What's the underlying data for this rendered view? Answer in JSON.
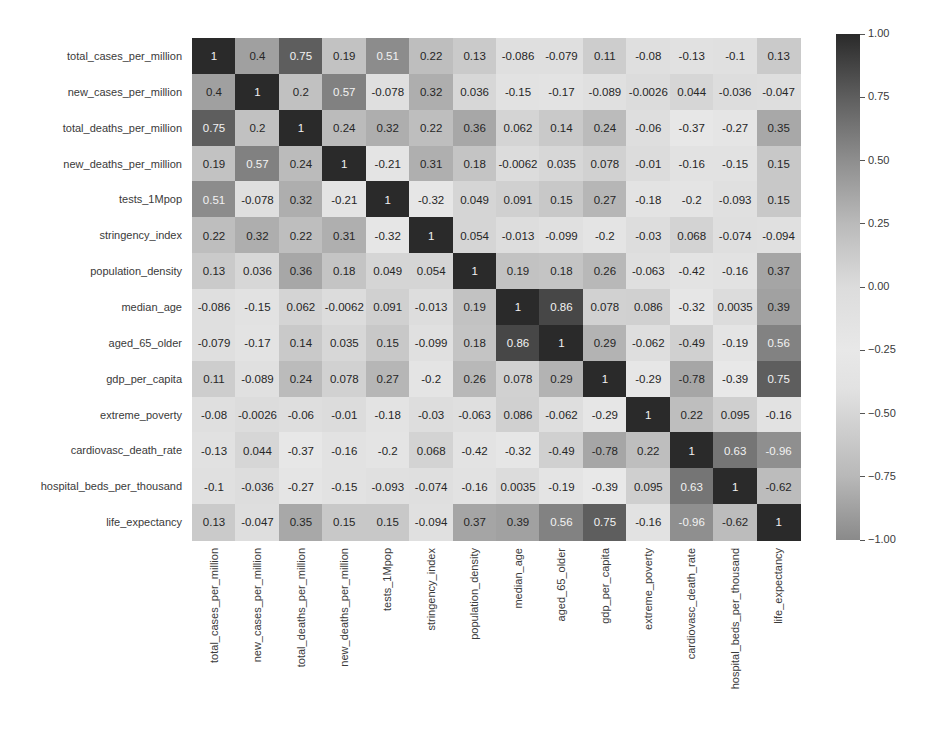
{
  "chart_data": {
    "type": "heatmap",
    "title": "",
    "xlabel": "",
    "ylabel": "",
    "labels": [
      "total_cases_per_million",
      "new_cases_per_million",
      "total_deaths_per_million",
      "new_deaths_per_million",
      "tests_1Mpop",
      "stringency_index",
      "population_density",
      "median_age",
      "aged_65_older",
      "gdp_per_capita",
      "extreme_poverty",
      "cardiovasc_death_rate",
      "hospital_beds_per_thousand",
      "life_expectancy"
    ],
    "matrix": [
      [
        "1",
        "0.4",
        "0.75",
        "0.19",
        "0.51",
        "0.22",
        "0.13",
        "-0.086",
        "-0.079",
        "0.11",
        "-0.08",
        "-0.13",
        "-0.1",
        "0.13"
      ],
      [
        "0.4",
        "1",
        "0.2",
        "0.57",
        "-0.078",
        "0.32",
        "0.036",
        "-0.15",
        "-0.17",
        "-0.089",
        "-0.0026",
        "0.044",
        "-0.036",
        "-0.047"
      ],
      [
        "0.75",
        "0.2",
        "1",
        "0.24",
        "0.32",
        "0.22",
        "0.36",
        "0.062",
        "0.14",
        "0.24",
        "-0.06",
        "-0.37",
        "-0.27",
        "0.35"
      ],
      [
        "0.19",
        "0.57",
        "0.24",
        "1",
        "-0.21",
        "0.31",
        "0.18",
        "-0.0062",
        "0.035",
        "0.078",
        "-0.01",
        "-0.16",
        "-0.15",
        "0.15"
      ],
      [
        "0.51",
        "-0.078",
        "0.32",
        "-0.21",
        "1",
        "-0.32",
        "0.049",
        "0.091",
        "0.15",
        "0.27",
        "-0.18",
        "-0.2",
        "-0.093",
        "0.15"
      ],
      [
        "0.22",
        "0.32",
        "0.22",
        "0.31",
        "-0.32",
        "1",
        "0.054",
        "-0.013",
        "-0.099",
        "-0.2",
        "-0.03",
        "0.068",
        "-0.074",
        "-0.094"
      ],
      [
        "0.13",
        "0.036",
        "0.36",
        "0.18",
        "0.049",
        "0.054",
        "1",
        "0.19",
        "0.18",
        "0.26",
        "-0.063",
        "-0.42",
        "-0.16",
        "0.37"
      ],
      [
        "-0.086",
        "-0.15",
        "0.062",
        "-0.0062",
        "0.091",
        "-0.013",
        "0.19",
        "1",
        "0.86",
        "0.078",
        "0.086",
        "-0.32",
        "0.0035",
        "0.39"
      ],
      [
        "-0.079",
        "-0.17",
        "0.14",
        "0.035",
        "0.15",
        "-0.099",
        "0.18",
        "0.86",
        "1",
        "0.29",
        "-0.062",
        "-0.49",
        "-0.19",
        "0.56"
      ],
      [
        "0.11",
        "-0.089",
        "0.24",
        "0.078",
        "0.27",
        "-0.2",
        "0.26",
        "0.078",
        "0.29",
        "1",
        "-0.29",
        "-0.78",
        "-0.39",
        "0.75"
      ],
      [
        "-0.08",
        "-0.0026",
        "-0.06",
        "-0.01",
        "-0.18",
        "-0.03",
        "-0.063",
        "0.086",
        "-0.062",
        "-0.29",
        "1",
        "0.22",
        "0.095",
        "-0.16"
      ],
      [
        "-0.13",
        "0.044",
        "-0.37",
        "-0.16",
        "-0.2",
        "0.068",
        "-0.42",
        "-0.32",
        "-0.49",
        "-0.78",
        "0.22",
        "1",
        "0.63",
        "-0.96"
      ],
      [
        "-0.1",
        "-0.036",
        "-0.27",
        "-0.15",
        "-0.093",
        "-0.074",
        "-0.16",
        "0.0035",
        "-0.19",
        "-0.39",
        "0.095",
        "0.63",
        "1",
        "-0.62"
      ],
      [
        "0.13",
        "-0.047",
        "0.35",
        "0.15",
        "0.15",
        "-0.094",
        "0.37",
        "0.39",
        "0.56",
        "0.75",
        "-0.16",
        "-0.96",
        "-0.62",
        "1"
      ]
    ],
    "colorbar": {
      "range": [
        -1.0,
        1.0
      ],
      "ticks": [
        "1.00",
        "0.75",
        "0.50",
        "0.25",
        "0.00",
        "−0.25",
        "−0.50",
        "−0.75",
        "−1.00"
      ],
      "tick_values": [
        1.0,
        0.75,
        0.5,
        0.25,
        0.0,
        -0.25,
        -0.5,
        -0.75,
        -1.0
      ]
    },
    "annotated": true,
    "grid": false,
    "legend_position": "right (colorbar)"
  }
}
